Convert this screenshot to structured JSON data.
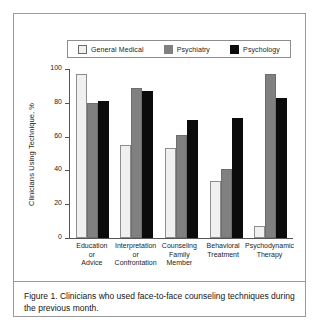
{
  "figure": {
    "caption": "Figure 1.  Clinicians who used face-to-face counseling techniques during the previous month."
  },
  "chart_data": {
    "type": "bar",
    "title": "",
    "xlabel": "",
    "ylabel": "Clinicians Using Technique, %",
    "ylim": [
      0,
      100
    ],
    "yticks": [
      0,
      20,
      40,
      60,
      80,
      100
    ],
    "ytick_labels": [
      "0",
      "20",
      "40",
      "60",
      "80",
      "100"
    ],
    "grid": false,
    "legend_position": "top",
    "categories": [
      "Education or Advice",
      "Interpretation or Confrontation",
      "Counseling Family Member",
      "Behavioral Treatment",
      "Psychodynamic Therapy"
    ],
    "category_lines": [
      [
        "Education",
        "or",
        "Advice"
      ],
      [
        "Interpretation",
        "or",
        "Confrontation"
      ],
      [
        "Counseling",
        "Family",
        "Member"
      ],
      [
        "Behavioral",
        "Treatment"
      ],
      [
        "Psychodynamic",
        "Therapy"
      ]
    ],
    "series": [
      {
        "name": "General Medical",
        "color": "#f0f0f0",
        "values": [
          97,
          55,
          53,
          34,
          7
        ]
      },
      {
        "name": "Psychiatry",
        "color": "#808080",
        "values": [
          80,
          89,
          61,
          41,
          97
        ]
      },
      {
        "name": "Psychology",
        "color": "#0b0b0b",
        "values": [
          81,
          87,
          70,
          71,
          83
        ]
      }
    ]
  }
}
